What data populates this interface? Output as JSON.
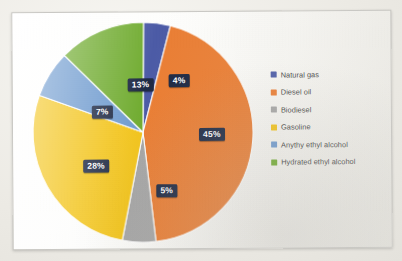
{
  "chart_data": {
    "type": "pie",
    "title": "",
    "subtitle": "",
    "xlabel": "",
    "ylabel": "",
    "grid": false,
    "legend_position": "right",
    "start_angle_deg": 0,
    "direction": "clockwise",
    "categories": [
      "Natural gas",
      "Diesel oil",
      "Biodiesel",
      "Gasoline",
      "Anythy ethyl alcohol",
      "Hydrated ethyl alcohol"
    ],
    "values": [
      4,
      45,
      5,
      28,
      7,
      13
    ],
    "data_labels": [
      "4%",
      "45%",
      "5%",
      "28%",
      "7%",
      "13%"
    ],
    "colors": [
      "#4B5BA8",
      "#ED7D31",
      "#A6A6A6",
      "#F5C518",
      "#6E9BD1",
      "#70AD2E"
    ],
    "slices": [
      {
        "label": "Natural gas",
        "value": 4,
        "data_label": "4%",
        "color": "#4B5BA8"
      },
      {
        "label": "Diesel oil",
        "value": 45,
        "data_label": "45%",
        "color": "#ED7D31"
      },
      {
        "label": "Biodiesel",
        "value": 5,
        "data_label": "5%",
        "color": "#A6A6A6"
      },
      {
        "label": "Gasoline",
        "value": 28,
        "data_label": "28%",
        "color": "#F5C518"
      },
      {
        "label": "Anythy ethyl alcohol",
        "value": 7,
        "data_label": "7%",
        "color": "#6E9BD1"
      },
      {
        "label": "Hydrated ethyl alcohol",
        "value": 13,
        "data_label": "13%",
        "color": "#70AD2E"
      }
    ]
  },
  "legend": {
    "items": [
      {
        "label": "Natural gas",
        "color": "#4B5BA8"
      },
      {
        "label": "Diesel oil",
        "color": "#ED7D31"
      },
      {
        "label": "Biodiesel",
        "color": "#A6A6A6"
      },
      {
        "label": "Gasoline",
        "color": "#F5C518"
      },
      {
        "label": "Anythy ethyl alcohol",
        "color": "#6E9BD1"
      },
      {
        "label": "Hydrated ethyl alcohol",
        "color": "#70AD2E"
      }
    ]
  },
  "labels": {
    "natural_gas": "4%",
    "diesel_oil": "45%",
    "biodiesel": "5%",
    "gasoline": "28%",
    "anythy_ethyl_alcohol": "7%",
    "hydrated_ethyl_alcohol": "13%"
  }
}
